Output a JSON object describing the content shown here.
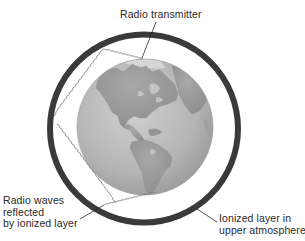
{
  "diagram": {
    "colors": {
      "background": "#ffffff",
      "ring": "#3a3a3a",
      "globe_ocean": "#b9b9b9",
      "globe_land": "#9a9a9a",
      "globe_ice": "#d4d4d4",
      "wave": "#7a7a7a",
      "leader_line": "#2a2a2a",
      "text": "#2a2a2a"
    },
    "labels": {
      "transmitter": "Radio transmitter",
      "waves": {
        "line1": "Radio waves",
        "line2": "reflected",
        "line3": "by ionized layer"
      },
      "ionized": {
        "line1": "Ionized layer in",
        "line2": "upper atmosphere"
      }
    },
    "elements": [
      {
        "name": "earth-globe",
        "description": "Earth showing North and South America"
      },
      {
        "name": "ionized-layer-ring",
        "description": "Dark ring representing the ionosphere"
      },
      {
        "name": "radio-wave-path",
        "description": "Wavy line zig-zagging between globe and ring"
      }
    ]
  }
}
